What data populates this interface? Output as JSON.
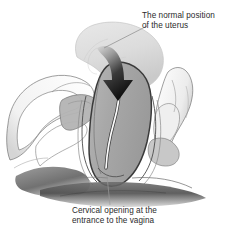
{
  "figure": {
    "type": "medical-anatomical-diagram",
    "background_color": "#ffffff"
  },
  "labels": {
    "top": {
      "text": "The normal position\nof the uterus",
      "line1": "The normal position",
      "line2": "of the uterus",
      "color": "#2b2b2b"
    },
    "bottom": {
      "text": "Cervical opening at the\nentrance to the vagina",
      "line1": "Cervical opening at the",
      "line2": "entrance to the vagina",
      "color": "#2b2b2b"
    }
  },
  "colors": {
    "background": "#ffffff",
    "ghost_uterus_fill": "#dedede",
    "ghost_uterus_stroke": "#c2c2c2",
    "prolapsed_uterus_fill": "#a9a9a9",
    "prolapsed_uterus_stroke": "#3a3a3a",
    "canal_fill": "#fbfbfb",
    "arrow_dark": "#131313",
    "arrow_light": "#d6d6d6",
    "tissue_white": "#fdfdfd",
    "tissue_outline": "#5a5a5a",
    "shadow_dark": "#555555",
    "shadow_darker": "#3c3c3c",
    "leader_line": "#8a8a8a",
    "text": "#2b2b2b"
  },
  "parts": [
    {
      "name": "ghosted-uterus-normal-position",
      "description": "Light gray outline of the uterus in its normal position, upper area"
    },
    {
      "name": "prolapsed-uterus",
      "description": "Medium gray descended uterus body at center"
    },
    {
      "name": "cervical-canal",
      "description": "White narrow canal running down the center of the uterus"
    },
    {
      "name": "descent-arrow",
      "description": "Curved arrow pointing downward indicating uterine descent"
    },
    {
      "name": "pelvic-tissue-left",
      "description": "White pelvic soft tissue structures on the left"
    },
    {
      "name": "pelvic-tissue-right",
      "description": "White pelvic soft tissue structures on the right"
    },
    {
      "name": "perineal-shadow",
      "description": "Dark shaded tissue across the lower portion"
    },
    {
      "name": "leader-line-top",
      "description": "Thin line connecting top label to the ghosted uterus"
    },
    {
      "name": "leader-line-bottom",
      "description": "Thin line connecting cervical opening to bottom caption"
    }
  ]
}
